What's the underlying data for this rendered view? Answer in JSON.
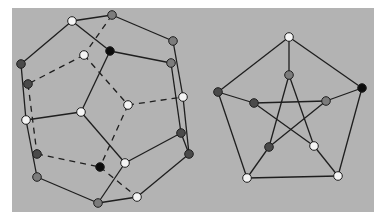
{
  "panel": {
    "x": 12,
    "y": 8,
    "width": 362,
    "height": 204,
    "color": "#b3b3b3"
  },
  "colors": {
    "white": "#f4f4f4",
    "gray": "#7c7c7c",
    "dark": "#4a4a4a",
    "black": "#0c0c0c",
    "edge": "#1e1e1e"
  },
  "dodecahedron": {
    "nodes": [
      {
        "id": "A",
        "x": 72,
        "y": 21,
        "fill": "white"
      },
      {
        "id": "B",
        "x": 112,
        "y": 15,
        "fill": "gray"
      },
      {
        "id": "C",
        "x": 110,
        "y": 51,
        "fill": "black"
      },
      {
        "id": "D",
        "x": 21,
        "y": 64,
        "fill": "dark"
      },
      {
        "id": "E",
        "x": 84,
        "y": 55,
        "fill": "white"
      },
      {
        "id": "F",
        "x": 28,
        "y": 84,
        "fill": "dark"
      },
      {
        "id": "G",
        "x": 173,
        "y": 41,
        "fill": "gray"
      },
      {
        "id": "H",
        "x": 171,
        "y": 63,
        "fill": "gray"
      },
      {
        "id": "I",
        "x": 183,
        "y": 97,
        "fill": "white"
      },
      {
        "id": "J",
        "x": 128,
        "y": 105,
        "fill": "white"
      },
      {
        "id": "K",
        "x": 81,
        "y": 112,
        "fill": "white"
      },
      {
        "id": "L",
        "x": 26,
        "y": 120,
        "fill": "white"
      },
      {
        "id": "M",
        "x": 37,
        "y": 154,
        "fill": "dark"
      },
      {
        "id": "N",
        "x": 37,
        "y": 177,
        "fill": "gray"
      },
      {
        "id": "O",
        "x": 100,
        "y": 167,
        "fill": "black"
      },
      {
        "id": "P",
        "x": 125,
        "y": 163,
        "fill": "white"
      },
      {
        "id": "Q",
        "x": 181,
        "y": 133,
        "fill": "dark"
      },
      {
        "id": "R",
        "x": 189,
        "y": 154,
        "fill": "dark"
      },
      {
        "id": "S",
        "x": 98,
        "y": 203,
        "fill": "gray"
      },
      {
        "id": "T",
        "x": 137,
        "y": 197,
        "fill": "white"
      }
    ],
    "edges": [
      [
        "A",
        "B",
        "solid"
      ],
      [
        "A",
        "D",
        "solid"
      ],
      [
        "A",
        "C",
        "solid"
      ],
      [
        "B",
        "G",
        "solid"
      ],
      [
        "C",
        "H",
        "solid"
      ],
      [
        "C",
        "K",
        "solid"
      ],
      [
        "G",
        "I",
        "solid"
      ],
      [
        "I",
        "R",
        "solid"
      ],
      [
        "H",
        "Q",
        "solid"
      ],
      [
        "Q",
        "R",
        "solid"
      ],
      [
        "D",
        "L",
        "solid"
      ],
      [
        "L",
        "K",
        "solid"
      ],
      [
        "K",
        "P",
        "solid"
      ],
      [
        "L",
        "N",
        "solid"
      ],
      [
        "N",
        "S",
        "solid"
      ],
      [
        "S",
        "P",
        "solid"
      ],
      [
        "S",
        "T",
        "solid"
      ],
      [
        "T",
        "R",
        "solid"
      ],
      [
        "P",
        "Q",
        "solid"
      ],
      [
        "B",
        "E",
        "dashed"
      ],
      [
        "E",
        "F",
        "dashed"
      ],
      [
        "E",
        "J",
        "dashed"
      ],
      [
        "J",
        "I",
        "dashed"
      ],
      [
        "J",
        "O",
        "dashed"
      ],
      [
        "F",
        "M",
        "dashed"
      ],
      [
        "M",
        "O",
        "dashed"
      ],
      [
        "O",
        "T",
        "dashed"
      ]
    ]
  },
  "petersen": {
    "nodes": [
      {
        "id": "o1",
        "x": 289,
        "y": 37,
        "fill": "white"
      },
      {
        "id": "o2",
        "x": 362,
        "y": 88,
        "fill": "black"
      },
      {
        "id": "o3",
        "x": 338,
        "y": 176,
        "fill": "white"
      },
      {
        "id": "o4",
        "x": 247,
        "y": 178,
        "fill": "white"
      },
      {
        "id": "o5",
        "x": 218,
        "y": 92,
        "fill": "dark"
      },
      {
        "id": "i1",
        "x": 289,
        "y": 75,
        "fill": "gray"
      },
      {
        "id": "i2",
        "x": 326,
        "y": 101,
        "fill": "gray"
      },
      {
        "id": "i3",
        "x": 314,
        "y": 146,
        "fill": "white"
      },
      {
        "id": "i4",
        "x": 269,
        "y": 147,
        "fill": "dark"
      },
      {
        "id": "i5",
        "x": 254,
        "y": 103,
        "fill": "dark"
      }
    ],
    "edges": [
      [
        "o1",
        "o2",
        "solid"
      ],
      [
        "o2",
        "o3",
        "solid"
      ],
      [
        "o3",
        "o4",
        "solid"
      ],
      [
        "o4",
        "o5",
        "solid"
      ],
      [
        "o5",
        "o1",
        "solid"
      ],
      [
        "o1",
        "i1",
        "solid"
      ],
      [
        "o2",
        "i2",
        "solid"
      ],
      [
        "o3",
        "i3",
        "solid"
      ],
      [
        "o4",
        "i4",
        "solid"
      ],
      [
        "o5",
        "i5",
        "solid"
      ],
      [
        "i1",
        "i3",
        "solid"
      ],
      [
        "i1",
        "i4",
        "solid"
      ],
      [
        "i5",
        "i2",
        "solid"
      ],
      [
        "i5",
        "i3",
        "solid"
      ],
      [
        "i2",
        "i4",
        "solid"
      ]
    ]
  }
}
